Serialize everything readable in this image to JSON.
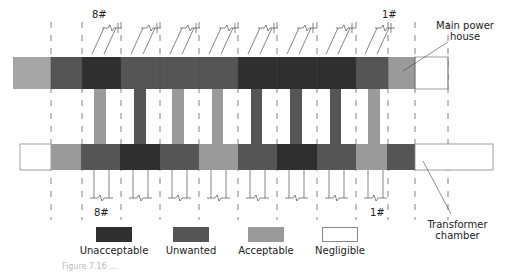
{
  "colors": {
    "unacceptable": "#2f2f2f",
    "unwanted": "#555555",
    "acceptable": "#9a9a9a",
    "negligible": "#ffffff",
    "edge_gray": "#a5a5a5",
    "outline": "#888888",
    "dash": "#666666"
  },
  "labels": {
    "top_left_unit": "8#",
    "top_right_unit": "1#",
    "bottom_left_unit": "8#",
    "bottom_right_unit": "1#",
    "main_power_house": "Main power house",
    "transformer_chamber": "Transformer chamber"
  },
  "legend": [
    {
      "label": "Unacceptable",
      "level": "unacceptable"
    },
    {
      "label": "Unwanted",
      "level": "unwanted"
    },
    {
      "label": "Acceptable",
      "level": "acceptable"
    },
    {
      "label": "Negligible",
      "level": "negligible"
    }
  ],
  "caption": "Figure 7.16 ...",
  "top_bar": [
    {
      "x": 13,
      "w": 38,
      "level": "edge_gray"
    },
    {
      "x": 51,
      "w": 31,
      "level": "unwanted"
    },
    {
      "x": 82,
      "w": 39,
      "level": "unacceptable"
    },
    {
      "x": 121,
      "w": 39,
      "level": "unwanted"
    },
    {
      "x": 160,
      "w": 39,
      "level": "unwanted"
    },
    {
      "x": 199,
      "w": 39,
      "level": "unwanted"
    },
    {
      "x": 238,
      "w": 39,
      "level": "unacceptable"
    },
    {
      "x": 277,
      "w": 40,
      "level": "unacceptable"
    },
    {
      "x": 317,
      "w": 39,
      "level": "unacceptable"
    },
    {
      "x": 356,
      "w": 32,
      "level": "unwanted"
    },
    {
      "x": 388,
      "w": 27,
      "level": "acceptable"
    },
    {
      "x": 415,
      "w": 33,
      "level": "negligible"
    }
  ],
  "bottom_bar": [
    {
      "x": 20,
      "w": 31,
      "level": "negligible"
    },
    {
      "x": 51,
      "w": 30,
      "level": "acceptable"
    },
    {
      "x": 81,
      "w": 39,
      "level": "unwanted"
    },
    {
      "x": 120,
      "w": 40,
      "level": "unacceptable"
    },
    {
      "x": 160,
      "w": 39,
      "level": "unwanted"
    },
    {
      "x": 199,
      "w": 39,
      "level": "acceptable"
    },
    {
      "x": 238,
      "w": 39,
      "level": "unwanted"
    },
    {
      "x": 277,
      "w": 40,
      "level": "unacceptable"
    },
    {
      "x": 317,
      "w": 39,
      "level": "unwanted"
    },
    {
      "x": 356,
      "w": 31,
      "level": "acceptable"
    },
    {
      "x": 387,
      "w": 28,
      "level": "unwanted"
    },
    {
      "x": 415,
      "w": 78,
      "level": "negligible"
    }
  ],
  "connectors": [
    {
      "x": 94,
      "w": 12,
      "level": "acceptable"
    },
    {
      "x": 134,
      "w": 12,
      "level": "unwanted"
    },
    {
      "x": 172,
      "w": 12,
      "level": "acceptable"
    },
    {
      "x": 212,
      "w": 11,
      "level": "acceptable"
    },
    {
      "x": 251,
      "w": 11,
      "level": "unwanted"
    },
    {
      "x": 290,
      "w": 12,
      "level": "unwanted"
    },
    {
      "x": 330,
      "w": 11,
      "level": "unwanted"
    },
    {
      "x": 368,
      "w": 12,
      "level": "acceptable"
    }
  ],
  "dash_lines_x": [
    51,
    82,
    121,
    160,
    199,
    238,
    277,
    317,
    356,
    388,
    415,
    448
  ]
}
